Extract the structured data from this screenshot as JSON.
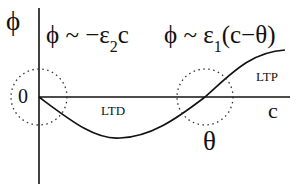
{
  "diagram": {
    "y_axis_label": "ϕ",
    "x_axis_label": "c",
    "origin_label": "0",
    "threshold_label": "θ",
    "region_ltd": "LTD",
    "region_ltp": "LTP",
    "formula_left": {
      "prefix": "ϕ ~ −ε",
      "subscript": "2",
      "suffix": "c"
    },
    "formula_right": {
      "prefix": "ϕ ~ ε",
      "subscript": "1",
      "suffix": "(c−θ)"
    },
    "colors": {
      "line": "#111111",
      "dotted": "#333333",
      "background": "#ffffff"
    }
  }
}
